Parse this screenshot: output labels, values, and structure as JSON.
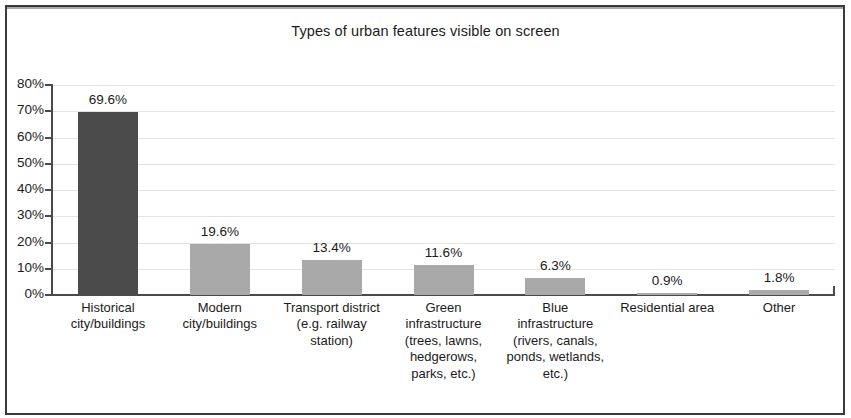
{
  "chart_data": {
    "type": "bar",
    "title": "Types of urban features visible on screen",
    "xlabel": "",
    "ylabel": "",
    "ylim": [
      0,
      80
    ],
    "grid": true,
    "legend": "none",
    "ytick_labels": [
      "80%",
      "70%",
      "60%",
      "50%",
      "40%",
      "30%",
      "20%",
      "10%",
      "0%"
    ],
    "ytick_values": [
      80,
      70,
      60,
      50,
      40,
      30,
      20,
      10,
      0
    ],
    "categories": [
      "Historical city/buildings",
      "Modern city/buildings",
      "Transport district (e.g. railway station)",
      "Green infrastructure (trees, lawns, hedgerows, parks, etc.)",
      "Blue infrastructure (rivers, canals, ponds, wetlands, etc.)",
      "Residential area",
      "Other"
    ],
    "category_lines": [
      [
        "Historical",
        "city/buildings"
      ],
      [
        "Modern",
        "city/buildings"
      ],
      [
        "Transport district",
        "(e.g. railway",
        "station)"
      ],
      [
        "Green",
        "infrastructure",
        "(trees, lawns,",
        "hedgerows,",
        "parks, etc.)"
      ],
      [
        "Blue",
        "infrastructure",
        "(rivers, canals,",
        "ponds, wetlands,",
        "etc.)"
      ],
      [
        "Residential area"
      ],
      [
        "Other"
      ]
    ],
    "values": [
      69.6,
      19.6,
      13.4,
      11.6,
      6.3,
      0.9,
      1.8
    ],
    "value_labels": [
      "69.6%",
      "19.6%",
      "13.4%",
      "11.6%",
      "6.3%",
      "0.9%",
      "1.8%"
    ],
    "bar_colors": [
      "#4b4b4b",
      "#a9a9a9",
      "#a9a9a9",
      "#a9a9a9",
      "#a9a9a9",
      "#a9a9a9",
      "#a9a9a9"
    ],
    "axis_color": "#4a4a4a",
    "grid_color": "#e2e2e2",
    "text_color": "#1b1b1b",
    "background": "#ffffff"
  }
}
